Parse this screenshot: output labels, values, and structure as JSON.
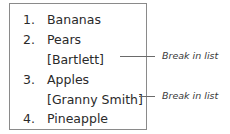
{
  "list": {
    "items": [
      {
        "number": "1.",
        "text": "Bananas"
      },
      {
        "number": "2.",
        "text": "Pears"
      },
      {
        "number": "",
        "text": "[Bartlett]"
      },
      {
        "number": "3.",
        "text": "Apples"
      },
      {
        "number": "",
        "text": "[Granny Smith]"
      },
      {
        "number": "4.",
        "text": "Pineapple"
      }
    ]
  },
  "callouts": [
    {
      "label": "Break in list",
      "target": "[Bartlett]"
    },
    {
      "label": "Break in list",
      "target": "[Granny Smith]"
    }
  ]
}
